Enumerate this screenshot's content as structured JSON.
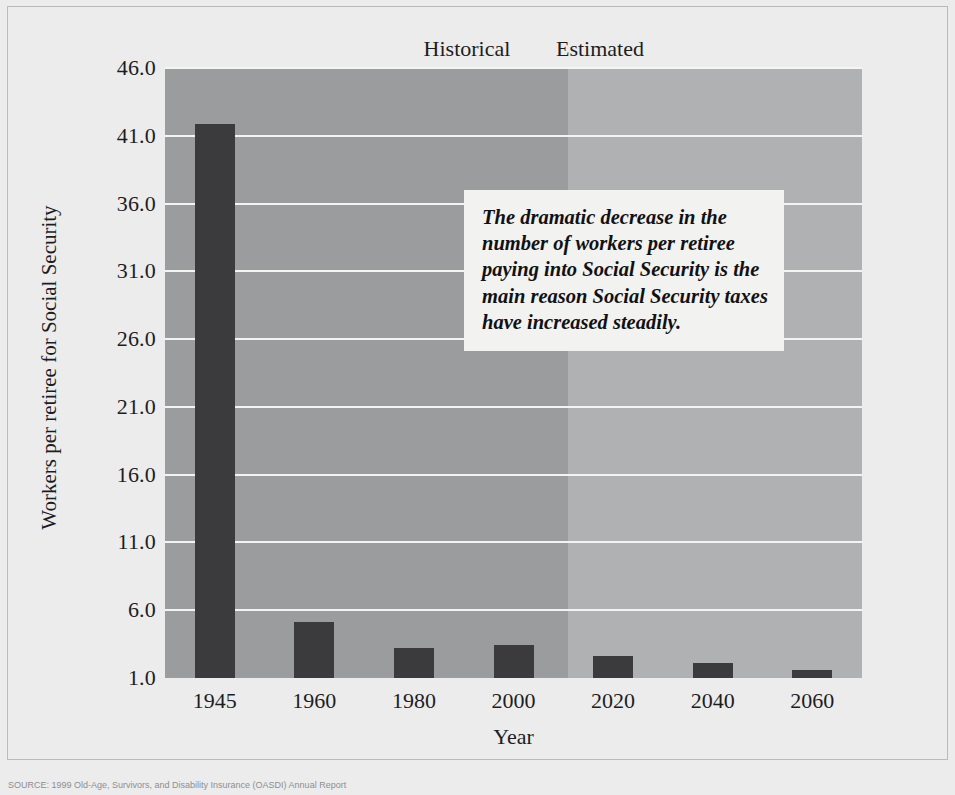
{
  "figure": {
    "background_color": "#ececed",
    "source_caption": "SOURCE: 1999 Old-Age, Survivors, and Disability Insurance (OASDI) Annual Report"
  },
  "period_labels": {
    "historical": "Historical",
    "estimated": "Estimated"
  },
  "callout": {
    "text": "The dramatic decrease in the number of workers per retiree paying into Social Security is the main reason Social Security taxes have increased steadily."
  },
  "chart_data": {
    "type": "bar",
    "title": "",
    "xlabel": "Year",
    "ylabel": "Workers per retiree for Social Security",
    "categories": [
      "1945",
      "1960",
      "1980",
      "2000",
      "2020",
      "2040",
      "2060"
    ],
    "values": [
      41.9,
      5.1,
      3.2,
      3.4,
      2.6,
      2.1,
      1.6
    ],
    "ylim": [
      1.0,
      46.0
    ],
    "yticks": [
      "46.0",
      "41.0",
      "36.0",
      "31.0",
      "26.0",
      "21.0",
      "16.0",
      "11.0",
      "6.0",
      "1.0"
    ],
    "ytick_values": [
      46.0,
      41.0,
      36.0,
      31.0,
      26.0,
      21.0,
      16.0,
      11.0,
      6.0,
      1.0
    ],
    "grid": true,
    "legend": "none",
    "bar_color": "#3b3b3d",
    "gridline_color": "#f4f4f2",
    "bands": [
      {
        "name": "Historical",
        "color": "#9b9c9e",
        "from": "1945",
        "to": "2010"
      },
      {
        "name": "Estimated",
        "color": "#b0b1b2",
        "from": "2010",
        "to": "2060"
      }
    ]
  }
}
